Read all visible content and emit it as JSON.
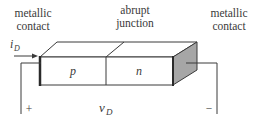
{
  "diagram": {
    "labels": {
      "left_contact_line1": "metallic",
      "left_contact_line2": "contact",
      "junction_line1": "abrupt",
      "junction_line2": "junction",
      "right_contact_line1": "metallic",
      "right_contact_line2": "contact",
      "current_symbol": "i",
      "current_subscript": "D",
      "p_region": "p",
      "n_region": "n",
      "voltage_symbol": "v",
      "voltage_subscript": "D",
      "plus_terminal": "+",
      "minus_terminal": "−"
    },
    "colors": {
      "outline": "#3a3a3a",
      "contact_face": "#a6a6a6",
      "background": "#ffffff"
    }
  }
}
